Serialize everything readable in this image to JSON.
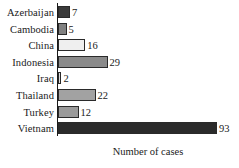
{
  "chart_data": {
    "type": "bar",
    "orientation": "horizontal",
    "title": "",
    "subtitle": "",
    "xlabel": "Number of cases",
    "ylabel": "",
    "grid": false,
    "legend": null,
    "xlim": [
      0,
      100
    ],
    "categories": [
      "Azerbaijan",
      "Cambodia",
      "China",
      "Indonesia",
      "Iraq",
      "Thailand",
      "Turkey",
      "Vietnam"
    ],
    "values": [
      7,
      5,
      16,
      29,
      2,
      22,
      12,
      93
    ],
    "value_labels": [
      "7",
      "5",
      "16",
      "29",
      "2",
      "22",
      "12",
      "93"
    ],
    "bar_colors": [
      "#3a3a3a",
      "#808080",
      "#efefef",
      "#8a8a8a",
      "#dcdcdc",
      "#a2a2a2",
      "#9a9a9a",
      "#2b2b2b"
    ],
    "bar_edge_color": "#2a2a2a",
    "axis_color": "#1a1a1a",
    "background": "#ffffff",
    "px_per_unit": 1.71
  }
}
